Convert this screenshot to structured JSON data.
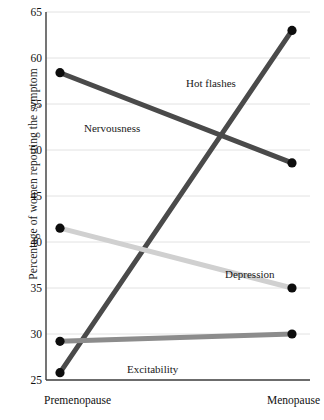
{
  "chart_data": {
    "type": "line",
    "title": "",
    "xlabel": "",
    "ylabel": "Percentage of women reporting the symptom",
    "categories": [
      "Premenopause",
      "Menopause"
    ],
    "ylim": [
      25,
      65
    ],
    "yticks": [
      25,
      30,
      35,
      40,
      45,
      50,
      55,
      60,
      65
    ],
    "grid": true,
    "legend_position": "inline-annotations",
    "series": [
      {
        "name": "Hot flashes",
        "values": [
          25.8,
          63.0
        ],
        "color": "#4a4a4a"
      },
      {
        "name": "Nervousness",
        "values": [
          58.4,
          48.6
        ],
        "color": "#4a4a4a"
      },
      {
        "name": "Depression",
        "values": [
          41.5,
          35.0
        ],
        "color": "#d0d0d0"
      },
      {
        "name": "Excitability",
        "values": [
          29.2,
          30.0
        ],
        "color": "#8c8c8c"
      }
    ],
    "annotations": [
      {
        "text": "Hot flashes",
        "x": 186,
        "y": 77
      },
      {
        "text": "Nervousness",
        "x": 84,
        "y": 122
      },
      {
        "text": "Depression",
        "x": 225,
        "y": 268
      },
      {
        "text": "Excitability",
        "x": 127,
        "y": 363
      }
    ]
  },
  "axis": {
    "y_title": "Percentage of women reporting the symptom",
    "y_ticks": [
      "65",
      "60",
      "55",
      "50",
      "45",
      "40",
      "35",
      "30",
      "25"
    ],
    "x_left": "Premenopause",
    "x_right": "Menopause"
  },
  "colors": {
    "dark_line": "#4a4a4a",
    "mid_line": "#8c8c8c",
    "light_line": "#d0d0d0",
    "marker": "#0d0d0d",
    "grid": "#e2e2e2",
    "axis": "#3b3b3b"
  }
}
